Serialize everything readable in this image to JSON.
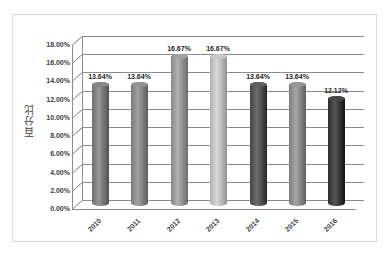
{
  "chart_data": {
    "type": "bar",
    "title": "",
    "xlabel": "",
    "ylabel": "百分比",
    "categories": [
      "2010",
      "2011",
      "2012",
      "2013",
      "2014",
      "2015",
      "2016"
    ],
    "values": [
      13.64,
      13.64,
      16.67,
      16.67,
      13.64,
      13.64,
      12.12
    ],
    "value_labels": [
      "13.64%",
      "13.64%",
      "16.67%",
      "16.67%",
      "13.64%",
      "13.64%",
      "12.12%"
    ],
    "bar_colors": [
      "#6e6e6e",
      "#7a7a7a",
      "#888888",
      "#b0b0b0",
      "#454545",
      "#7d7d7d",
      "#2e2e2e"
    ],
    "ylim": [
      0,
      18
    ],
    "yticks": [
      "0.00%",
      "2.00%",
      "4.00%",
      "6.00%",
      "8.00%",
      "10.00%",
      "12.00%",
      "14.00%",
      "16.00%",
      "18.00%"
    ],
    "grid": true,
    "legend": "none",
    "style": "3d-cylinder"
  }
}
